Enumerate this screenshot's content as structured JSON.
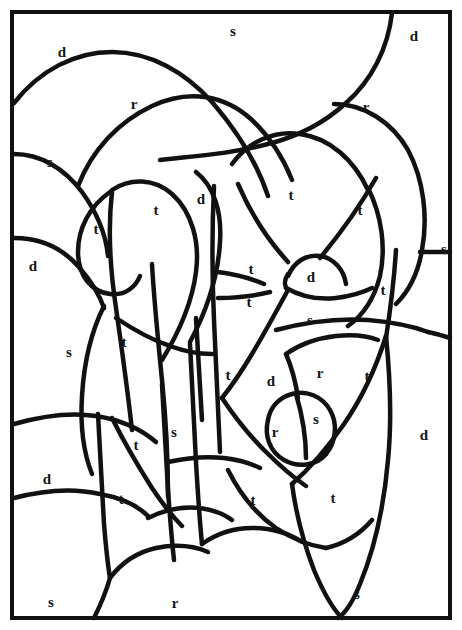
{
  "page": {
    "width": 462,
    "height": 630,
    "background_color": "#ffffff",
    "ink_color": "#111111",
    "letter_color": "#151515"
  },
  "frame": {
    "x": 12,
    "y": 12,
    "width": 438,
    "height": 606,
    "stroke_width": 4
  },
  "legend_letters": [
    "d",
    "r",
    "s",
    "t"
  ],
  "letters": [
    {
      "id": "L01",
      "char": "d",
      "x": 62,
      "y": 54
    },
    {
      "id": "L02",
      "char": "s",
      "x": 233,
      "y": 33
    },
    {
      "id": "L03",
      "char": "d",
      "x": 414,
      "y": 38
    },
    {
      "id": "L04",
      "char": "r",
      "x": 134,
      "y": 106
    },
    {
      "id": "L05",
      "char": "r",
      "x": 366,
      "y": 109
    },
    {
      "id": "L06",
      "char": "s",
      "x": 50,
      "y": 164
    },
    {
      "id": "L07",
      "char": "d",
      "x": 201,
      "y": 201
    },
    {
      "id": "L08",
      "char": "t",
      "x": 291,
      "y": 197
    },
    {
      "id": "L09",
      "char": "t",
      "x": 360,
      "y": 212
    },
    {
      "id": "L10",
      "char": "t",
      "x": 156,
      "y": 212
    },
    {
      "id": "L11",
      "char": "t",
      "x": 96,
      "y": 231
    },
    {
      "id": "L12",
      "char": "s",
      "x": 444,
      "y": 251
    },
    {
      "id": "L13",
      "char": "d",
      "x": 33,
      "y": 268
    },
    {
      "id": "L14",
      "char": "t",
      "x": 251,
      "y": 271
    },
    {
      "id": "L15",
      "char": "d",
      "x": 311,
      "y": 279
    },
    {
      "id": "L16",
      "char": "t",
      "x": 249,
      "y": 304
    },
    {
      "id": "L17",
      "char": "t",
      "x": 383,
      "y": 292
    },
    {
      "id": "L18",
      "char": "s",
      "x": 310,
      "y": 322
    },
    {
      "id": "L19",
      "char": "t",
      "x": 124,
      "y": 344
    },
    {
      "id": "L20",
      "char": "s",
      "x": 69,
      "y": 354
    },
    {
      "id": "L21",
      "char": "t",
      "x": 228,
      "y": 377
    },
    {
      "id": "L22",
      "char": "d",
      "x": 271,
      "y": 383
    },
    {
      "id": "L23",
      "char": "r",
      "x": 320,
      "y": 375
    },
    {
      "id": "L24",
      "char": "t",
      "x": 367,
      "y": 378
    },
    {
      "id": "L25",
      "char": "s",
      "x": 316,
      "y": 421
    },
    {
      "id": "L26",
      "char": "r",
      "x": 275,
      "y": 434
    },
    {
      "id": "L27",
      "char": "d",
      "x": 424,
      "y": 437
    },
    {
      "id": "L28",
      "char": "s",
      "x": 174,
      "y": 434
    },
    {
      "id": "L29",
      "char": "t",
      "x": 136,
      "y": 447
    },
    {
      "id": "L30",
      "char": "d",
      "x": 47,
      "y": 481
    },
    {
      "id": "L31",
      "char": "t",
      "x": 121,
      "y": 501
    },
    {
      "id": "L32",
      "char": "t",
      "x": 253,
      "y": 502
    },
    {
      "id": "L33",
      "char": "t",
      "x": 333,
      "y": 500
    },
    {
      "id": "L34",
      "char": "s",
      "x": 51,
      "y": 604
    },
    {
      "id": "L35",
      "char": "r",
      "x": 175,
      "y": 605
    },
    {
      "id": "L36",
      "char": "s",
      "x": 357,
      "y": 596
    }
  ],
  "curves": [
    {
      "id": "C01",
      "name": "top-left-dome",
      "w": 4.5,
      "d": "M14,103 C40,70 75,52 112,52 C150,52 185,72 212,102 C238,132 258,166 268,196"
    },
    {
      "id": "C02",
      "name": "upper-arch-inner",
      "w": 4.5,
      "d": "M78,186 C92,150 118,122 152,106 C190,88 226,96 252,120 C272,139 284,160 292,180"
    },
    {
      "id": "C03",
      "name": "top-right-sweep",
      "w": 4.5,
      "d": "M392,13 C388,48 372,80 346,103 C322,125 296,137 268,144 C230,154 196,156 160,160"
    },
    {
      "id": "C04",
      "name": "right-top-curve",
      "w": 4.5,
      "d": "M334,104 C364,104 392,122 408,150 C424,180 428,218 422,250 C418,274 408,292 396,304"
    },
    {
      "id": "C05",
      "name": "right-edge-stub",
      "w": 4.5,
      "d": "M420,252 C432,252 442,252 450,252"
    },
    {
      "id": "C06",
      "name": "left-upper-arc",
      "w": 4.5,
      "d": "M14,154 C40,154 64,168 82,192 C98,214 106,236 108,256"
    },
    {
      "id": "C07",
      "name": "left-mid-arc",
      "w": 4.5,
      "d": "M14,238 C40,238 62,248 78,266 C92,282 100,296 104,308"
    },
    {
      "id": "C08",
      "name": "teardrop-left",
      "w": 4.5,
      "d": "M110,192 C90,206 78,228 78,252 C78,276 92,292 110,294 C126,296 136,286 140,276"
    },
    {
      "id": "C09",
      "name": "petal-big-left",
      "w": 4.5,
      "d": "M112,190 C130,178 154,178 172,194 C192,212 200,242 196,272 C192,304 178,334 162,360"
    },
    {
      "id": "C10",
      "name": "petal-big-right",
      "w": 4.5,
      "d": "M196,172 C214,186 222,212 220,242 C218,278 206,312 190,342"
    },
    {
      "id": "C11",
      "name": "center-stalk-left",
      "w": 4.5,
      "d": "M112,192 C108,226 110,268 116,308 C122,350 128,394 132,430"
    },
    {
      "id": "C12",
      "name": "center-stalk-right",
      "w": 4.5,
      "d": "M152,264 C154,300 158,340 162,380 C166,420 168,460 168,496"
    },
    {
      "id": "C13",
      "name": "left-long-curve",
      "w": 4.5,
      "d": "M104,306 C92,330 84,362 82,396 C80,428 84,454 92,474"
    },
    {
      "id": "C14",
      "name": "left-low-arc",
      "w": 4.5,
      "d": "M14,424 C42,416 70,412 96,416 C122,420 142,430 156,442"
    },
    {
      "id": "C15",
      "name": "left-bottom-edge",
      "w": 4.5,
      "d": "M14,498 C44,490 74,488 100,494 C122,498 138,506 148,516"
    },
    {
      "id": "C16",
      "name": "lower-left-stalk",
      "w": 4.5,
      "d": "M98,414 C100,450 102,490 104,524 C106,548 108,566 110,578"
    },
    {
      "id": "C17",
      "name": "bottom-left-hook",
      "w": 4.5,
      "d": "M110,578 C122,562 138,552 156,548 C176,544 194,546 208,552"
    },
    {
      "id": "C18",
      "name": "bottom-s-r-divider",
      "w": 4.5,
      "d": "M110,578 C106,592 100,606 94,618"
    },
    {
      "id": "C19",
      "name": "mid-left-diag",
      "w": 4.5,
      "d": "M112,418 C124,442 138,466 152,488 C164,506 174,518 182,526"
    },
    {
      "id": "C20",
      "name": "col-divider-a",
      "w": 4.5,
      "d": "M162,384 C164,420 166,456 168,490 C170,518 172,542 174,560"
    },
    {
      "id": "C21",
      "name": "col-divider-b",
      "w": 4.5,
      "d": "M190,344 C192,382 194,424 196,462 C198,496 200,524 202,544"
    },
    {
      "id": "C22",
      "name": "center-vertical",
      "w": 4.5,
      "d": "M214,186 C212,228 212,276 214,320 C216,368 218,414 220,452"
    },
    {
      "id": "C23",
      "name": "center-left-branch",
      "w": 4.5,
      "d": "M168,462 C186,458 206,456 224,458 C240,460 252,464 260,468"
    },
    {
      "id": "C24",
      "name": "center-bot-sweep",
      "w": 4.5,
      "d": "M202,544 C216,534 234,528 252,528 C272,528 290,534 302,542"
    },
    {
      "id": "C25",
      "name": "bubble-top",
      "w": 4.5,
      "d": "M288,276 C294,262 306,254 320,256 C334,258 344,270 346,284"
    },
    {
      "id": "C26",
      "name": "bubble-bottom",
      "w": 4.5,
      "d": "M286,288 C300,296 318,300 336,298 C352,296 364,292 372,288"
    },
    {
      "id": "C27",
      "name": "bubble-neck",
      "w": 4.5,
      "d": "M288,274 C284,280 284,286 288,290"
    },
    {
      "id": "C28",
      "name": "t-fan-upper",
      "w": 4.5,
      "d": "M218,272 C234,274 250,278 264,284"
    },
    {
      "id": "C29",
      "name": "t-fan-lower",
      "w": 4.5,
      "d": "M218,298 C236,298 254,296 270,292"
    },
    {
      "id": "C30",
      "name": "big-right-oval-l",
      "w": 4.5,
      "d": "M232,164 C248,142 274,130 300,134 C330,138 354,160 368,190"
    },
    {
      "id": "C31",
      "name": "big-right-oval-r",
      "w": 4.5,
      "d": "M368,188 C382,216 386,248 380,276 C374,300 362,316 348,326"
    },
    {
      "id": "C32",
      "name": "oval-chord",
      "w": 4.5,
      "d": "M238,184 C250,212 268,240 288,262"
    },
    {
      "id": "C33",
      "name": "oval-diag",
      "w": 4.5,
      "d": "M376,178 C360,206 340,234 320,258"
    },
    {
      "id": "C34",
      "name": "right-vert-long",
      "w": 4.5,
      "d": "M396,250 C394,282 390,312 386,338"
    },
    {
      "id": "C35",
      "name": "right-horiz-band",
      "w": 4.5,
      "d": "M276,330 C306,322 338,318 368,320 C392,322 412,326 428,332"
    },
    {
      "id": "C36",
      "name": "right-band-lower",
      "w": 4.5,
      "d": "M428,332 C438,334 444,336 450,338"
    },
    {
      "id": "C37",
      "name": "right-diag-down",
      "w": 4.5,
      "d": "M386,336 C376,368 362,398 344,424 C326,450 308,470 292,484"
    },
    {
      "id": "C38",
      "name": "right-tail-bottom",
      "w": 4.5,
      "d": "M292,484 C296,514 304,544 314,570 C324,594 334,610 342,618"
    },
    {
      "id": "C39",
      "name": "far-right-tail",
      "w": 4.5,
      "d": "M386,336 C390,376 392,420 388,460 C384,506 374,550 360,584 C352,604 344,614 338,618"
    },
    {
      "id": "C40",
      "name": "circle-small-left",
      "w": 4.5,
      "d": "M268,420 C264,436 270,452 284,460 C298,468 316,466 326,454"
    },
    {
      "id": "C41",
      "name": "circle-small-right",
      "w": 4.5,
      "d": "M326,454 C336,442 338,424 330,410 C322,396 306,390 292,394 C278,398 270,408 268,420"
    },
    {
      "id": "C42",
      "name": "circle-chord",
      "w": 4.5,
      "d": "M296,394 C302,414 306,436 306,458"
    },
    {
      "id": "C43",
      "name": "mid-diag-left",
      "w": 4.5,
      "d": "M288,290 C276,312 264,334 252,354 C240,374 230,388 222,398"
    },
    {
      "id": "C44",
      "name": "mid-diag-right",
      "w": 4.5,
      "d": "M222,398 C234,416 248,434 264,450 C280,466 294,478 306,486"
    },
    {
      "id": "C45",
      "name": "r-wedge-arc",
      "w": 4.5,
      "d": "M286,354 C300,344 318,338 336,336 C354,334 368,336 378,340"
    },
    {
      "id": "C46",
      "name": "sector-join",
      "w": 4.5,
      "d": "M286,354 C292,368 296,384 298,398"
    },
    {
      "id": "C47",
      "name": "lower-right-arc",
      "w": 4.5,
      "d": "M228,470 C240,494 256,514 276,528 C294,540 312,546 326,548"
    },
    {
      "id": "C48",
      "name": "bottom-right-join",
      "w": 4.5,
      "d": "M326,548 C344,544 360,534 372,520"
    },
    {
      "id": "C49",
      "name": "s-column-left",
      "w": 4.5,
      "d": "M196,318 C198,352 200,388 202,420"
    },
    {
      "id": "C50",
      "name": "inner-arc-bridge",
      "w": 4.5,
      "d": "M116,318 C134,330 152,340 170,346 C186,352 200,354 212,354"
    },
    {
      "id": "C51",
      "name": "bottom-wave",
      "w": 4.5,
      "d": "M148,518 C164,510 182,506 200,508 C214,510 224,514 232,520"
    }
  ]
}
